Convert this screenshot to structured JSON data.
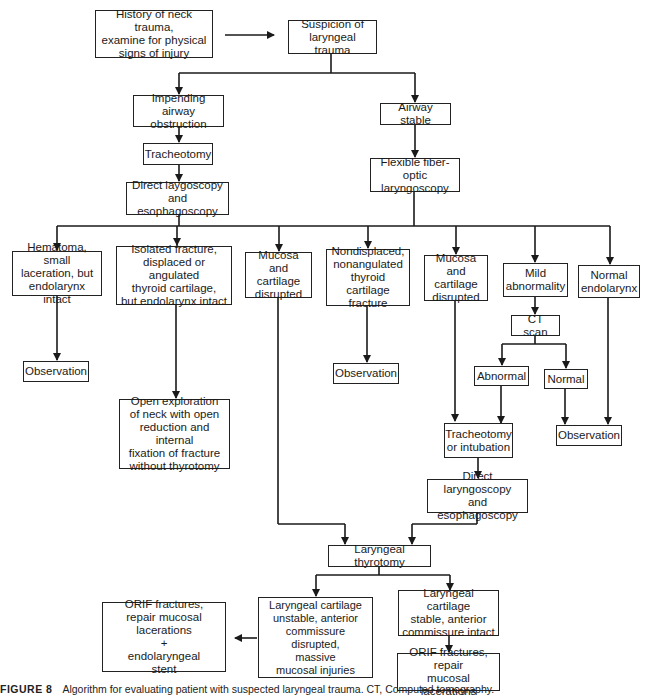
{
  "diagram": {
    "type": "flowchart",
    "title": "Algorithm for evaluating patient with suspected laryngeal trauma",
    "nodes": {
      "history": "History of neck trauma,\nexamine for physical\nsigns of injury",
      "suspicion": "Suspicion of\nlaryngeal trauma",
      "impending": "Impending airway\nobstruction",
      "airway_stable": "Airway stable",
      "tracheotomy_1": "Tracheotomy",
      "flexible": "Flexible fiber-optic\nlaryngoscopy",
      "direct_1": "Direct laygoscopy\nand esophagoscopy",
      "hematoma": "Hematoma, small\nlaceration, but\nendolarynx intact",
      "isolated_fracture": "Isolated fracture,\ndisplaced or angulated\nthyroid cartilage,\nbut endolarynx intact",
      "mucosa_1": "Mucosa and\ncartilage\ndisrupted",
      "nondisplaced": "Nondisplaced,\nnonangulated\nthyroid cartilage\nfracture",
      "mucosa_2": "Mucosa and\ncartilage\ndisrupted",
      "mild": "Mild\nabnormality",
      "normal_endolarynx": "Normal\nendolarynx",
      "observation_1": "Observation",
      "observation_2": "Observation",
      "ct_scan": "CT scan",
      "abnormal": "Abnormal",
      "normal": "Normal",
      "observation_3": "Observation",
      "open_exploration": "Open exploration\nof neck with open\nreduction and internal\nfixation of fracture\nwithout thyrotomy",
      "tracheotomy_intubation": "Tracheotomy\nor intubation",
      "direct_2": "Direct laryngoscopy\nand esophagoscopy",
      "laryngeal_thyrotomy": "Laryngeal thyrotomy",
      "unstable": "Laryngeal cartilage\nunstable, anterior\ncommissure disrupted,\nmassive\nmucosal injuries",
      "stable": "Laryngeal cartilage\nstable, anterior\ncommissure intact",
      "orif_stent": "ORIF fractures,\nrepair mucosal lacerations\n+\nendolaryngeal\nstent",
      "orif_repair": "ORIF fractures, repair\nmucosal lacerations"
    },
    "edges": [
      [
        "history",
        "suspicion"
      ],
      [
        "suspicion",
        "impending"
      ],
      [
        "suspicion",
        "airway_stable"
      ],
      [
        "impending",
        "tracheotomy_1"
      ],
      [
        "tracheotomy_1",
        "direct_1"
      ],
      [
        "airway_stable",
        "flexible"
      ],
      [
        "direct_1",
        "hematoma"
      ],
      [
        "direct_1",
        "isolated_fracture"
      ],
      [
        "direct_1",
        "mucosa_1"
      ],
      [
        "flexible",
        "nondisplaced"
      ],
      [
        "flexible",
        "mucosa_2"
      ],
      [
        "flexible",
        "mild"
      ],
      [
        "flexible",
        "normal_endolarynx"
      ],
      [
        "hematoma",
        "observation_1"
      ],
      [
        "isolated_fracture",
        "open_exploration"
      ],
      [
        "nondisplaced",
        "observation_2"
      ],
      [
        "mild",
        "ct_scan"
      ],
      [
        "ct_scan",
        "abnormal"
      ],
      [
        "ct_scan",
        "normal"
      ],
      [
        "abnormal",
        "tracheotomy_intubation"
      ],
      [
        "mucosa_2",
        "tracheotomy_intubation"
      ],
      [
        "normal",
        "observation_3"
      ],
      [
        "normal_endolarynx",
        "observation_3"
      ],
      [
        "tracheotomy_intubation",
        "direct_2"
      ],
      [
        "mucosa_1",
        "laryngeal_thyrotomy"
      ],
      [
        "direct_2",
        "laryngeal_thyrotomy"
      ],
      [
        "laryngeal_thyrotomy",
        "unstable"
      ],
      [
        "laryngeal_thyrotomy",
        "stable"
      ],
      [
        "unstable",
        "orif_stent"
      ],
      [
        "stable",
        "orif_repair"
      ]
    ]
  },
  "caption": {
    "label": "FIGURE 8",
    "text": "Algorithm for evaluating patient with suspected laryngeal trauma. CT, Computed tomography."
  }
}
